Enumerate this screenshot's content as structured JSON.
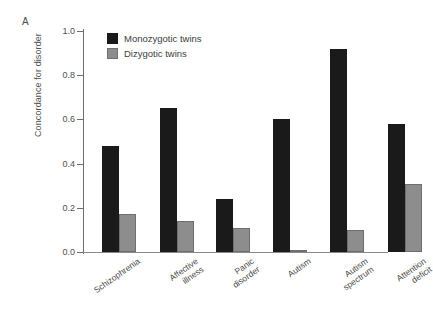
{
  "panel": {
    "label": "A"
  },
  "chart_data": {
    "type": "bar",
    "title": "",
    "xlabel": "",
    "ylabel": "Concordance for disorder",
    "ylim": [
      0.0,
      1.0
    ],
    "ytick_labels": [
      "1.0",
      "0.8",
      "0.6",
      "0.4",
      "0.2",
      "0.0"
    ],
    "ytick_values": [
      1.0,
      0.8,
      0.6,
      0.4,
      0.2,
      0.0
    ],
    "grid": false,
    "legend_position": "top-left-inside",
    "categories": [
      "Schizophrenia",
      "Affective illness",
      "Panic disorder",
      "Autism",
      "Autism spectrum",
      "Attention deficit"
    ],
    "category_lines": [
      [
        "Schizophrenia"
      ],
      [
        "Affective",
        "illness"
      ],
      [
        "Panic",
        "disorder"
      ],
      [
        "Autism"
      ],
      [
        "Autism",
        "spectrum"
      ],
      [
        "Attention",
        "deficit"
      ]
    ],
    "series": [
      {
        "name": "Monozygotic twins",
        "color": "#1a1a1a",
        "values": [
          0.48,
          0.65,
          0.24,
          0.6,
          0.92,
          0.58
        ]
      },
      {
        "name": "Dizygotic twins",
        "color": "#8d8d8d",
        "values": [
          0.17,
          0.14,
          0.11,
          0.01,
          0.1,
          0.31
        ]
      }
    ]
  },
  "legend": {
    "items": [
      {
        "label": "Monozygotic twins",
        "color": "#1a1a1a"
      },
      {
        "label": "Dizygotic twins",
        "color": "#8d8d8d"
      }
    ]
  }
}
